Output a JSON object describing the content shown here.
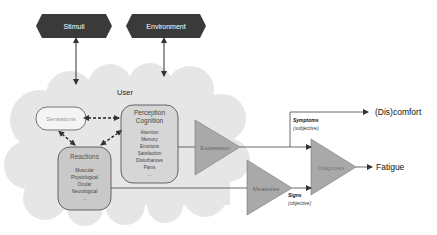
{
  "diagram": {
    "inputs": [
      {
        "label": "Stimuli"
      },
      {
        "label": "Environment"
      }
    ],
    "user": {
      "label": "User",
      "sensations": {
        "label": "Sensations"
      },
      "perception": {
        "title1": "Perception",
        "title2": "Cognition",
        "items": [
          "Attention",
          "Memory",
          "Emotions",
          "Satisfaction",
          "Disturbances",
          "Pains",
          "..."
        ]
      },
      "reactions": {
        "title": "Reactions",
        "items": [
          "Muscular",
          "Physiological",
          "Ocular",
          "Neurological",
          "..."
        ]
      }
    },
    "processes": {
      "expression": "Expression",
      "measures": "Measures",
      "diagnosis": "Diagnosis"
    },
    "paths": {
      "symptoms": "Symptoms",
      "symptoms_sub": "(subjective)",
      "signs": "Signs",
      "signs_sub": "(objective)"
    },
    "outputs": {
      "discomfort": "(Dis)comfort",
      "fatigue": "Fatigue"
    },
    "colors": {
      "hexagon": "#3a3a3a",
      "cloud": "#e6e6e6",
      "box_fill": "#d0d0d0",
      "triangle_fill": "#a9a9a9",
      "line": "#333333"
    }
  }
}
